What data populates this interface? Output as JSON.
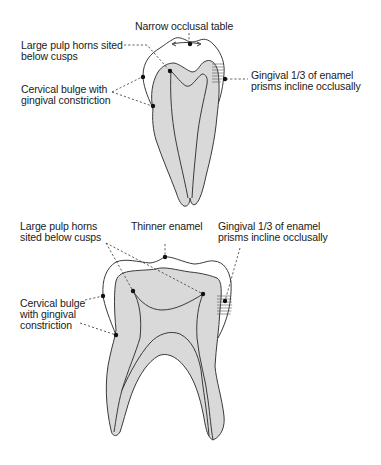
{
  "diagram": {
    "colors": {
      "dentin_fill": "#d9d9d9",
      "outline": "#3a3a3a",
      "background": "#ffffff"
    },
    "top_tooth": {
      "name": "premolar",
      "labels": {
        "occlusal_table": "Narrow occlusal table",
        "pulp_horns": "Large pulp horns sited\nbelow cusps",
        "cervical_bulge": "Cervical bulge with\ngingival constriction",
        "enamel_prisms": "Gingival 1/3 of enamel\nprisms incline occlusally"
      }
    },
    "bottom_tooth": {
      "name": "molar",
      "labels": {
        "pulp_horns": "Large pulp horns\nsited below cusps",
        "thinner_enamel": "Thinner enamel",
        "enamel_prisms": "Gingival 1/3 of enamel\nprisms incline occlusally",
        "cervical_bulge": "Cervical bulge\nwith gingival\nconstriction"
      }
    }
  }
}
